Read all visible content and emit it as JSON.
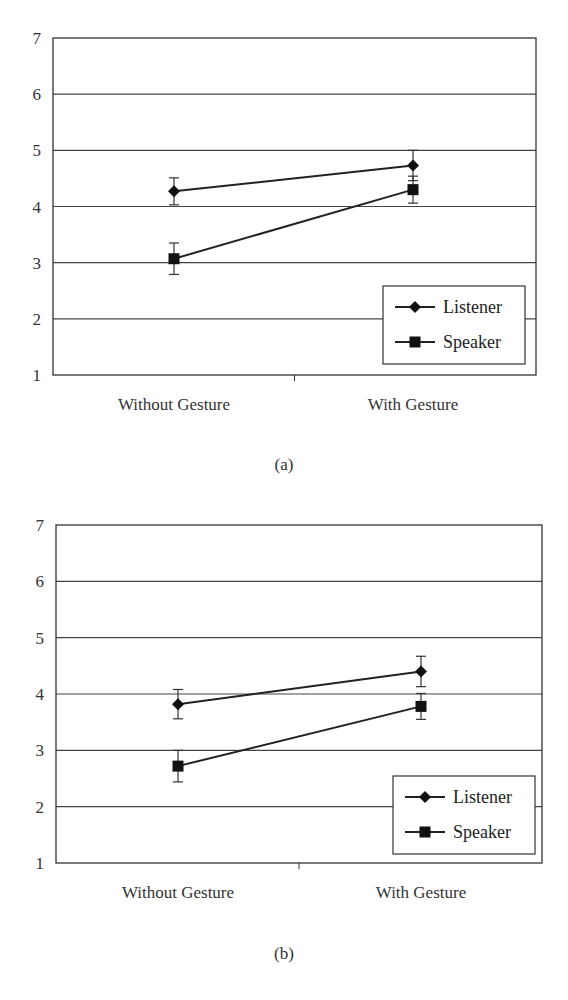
{
  "chart_data": [
    {
      "panel": "(a)",
      "type": "line",
      "categories": [
        "Without Gesture",
        "With Gesture"
      ],
      "series": [
        {
          "name": "Listener",
          "marker": "diamond",
          "values": [
            4.27,
            4.73
          ],
          "error": [
            0.24,
            0.27
          ]
        },
        {
          "name": "Speaker",
          "marker": "square",
          "values": [
            3.07,
            4.3
          ],
          "error": [
            0.28,
            0.24
          ]
        }
      ],
      "ylim": [
        1,
        7
      ],
      "yticks": [
        1,
        2,
        3,
        4,
        5,
        6,
        7
      ],
      "grid": true,
      "legend_position": "lower right",
      "xlabel": "",
      "ylabel": ""
    },
    {
      "panel": "(b)",
      "type": "line",
      "categories": [
        "Without Gesture",
        "With Gesture"
      ],
      "series": [
        {
          "name": "Listener",
          "marker": "diamond",
          "values": [
            3.82,
            4.4
          ],
          "error": [
            0.26,
            0.27
          ]
        },
        {
          "name": "Speaker",
          "marker": "square",
          "values": [
            2.72,
            3.78
          ],
          "error": [
            0.28,
            0.23
          ]
        }
      ],
      "ylim": [
        1,
        7
      ],
      "yticks": [
        1,
        2,
        3,
        4,
        5,
        6,
        7
      ],
      "grid": true,
      "legend_position": "lower right",
      "xlabel": "",
      "ylabel": ""
    }
  ],
  "labels": {
    "a": "(a)",
    "b": "(b)"
  }
}
